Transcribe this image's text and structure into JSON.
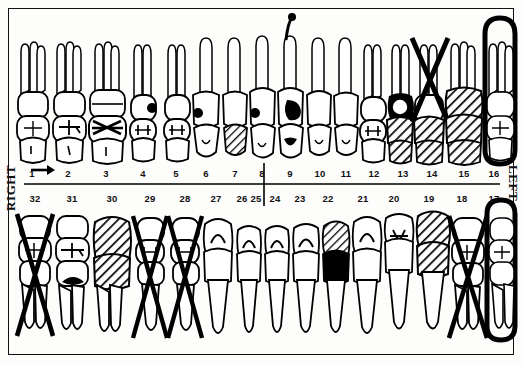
{
  "chart": {
    "type": "odontogram",
    "frame_color": "#111111",
    "background": "#fdfdfc",
    "ink_color": "#000000"
  },
  "labels": {
    "right": "RIGHT",
    "left": "LEFT",
    "arrow": "arrow-right"
  },
  "arch_upper": {
    "name": "maxillary-arch",
    "numbers": [
      "1",
      "2",
      "3",
      "4",
      "5",
      "6",
      "7",
      "8",
      "9",
      "10",
      "11",
      "12",
      "13",
      "14",
      "15",
      "16"
    ]
  },
  "arch_lower": {
    "name": "mandibular-arch",
    "numbers": [
      "32",
      "31",
      "30",
      "29",
      "28",
      "27",
      "26",
      "25",
      "24",
      "23",
      "22",
      "21",
      "20",
      "19",
      "18",
      "17"
    ]
  },
  "teeth_upper": [
    {
      "n": "1",
      "type": "molar",
      "mark": "none"
    },
    {
      "n": "2",
      "type": "molar",
      "mark": "occlusal-line"
    },
    {
      "n": "3",
      "type": "molar",
      "mark": "occlusal-cross"
    },
    {
      "n": "4",
      "type": "premolar",
      "mark": "occlusal-line"
    },
    {
      "n": "5",
      "type": "premolar",
      "mark": "occlusal-line"
    },
    {
      "n": "6",
      "type": "canine",
      "mark": "none"
    },
    {
      "n": "7",
      "type": "incisor",
      "mark": "hatched"
    },
    {
      "n": "8",
      "type": "incisor",
      "mark": "none"
    },
    {
      "n": "9",
      "type": "incisor",
      "mark": "filled-lesion"
    },
    {
      "n": "10",
      "type": "incisor",
      "mark": "none"
    },
    {
      "n": "11",
      "type": "canine",
      "mark": "none"
    },
    {
      "n": "12",
      "type": "premolar",
      "mark": "occlusal-line"
    },
    {
      "n": "13",
      "type": "premolar",
      "mark": "filled-hatched"
    },
    {
      "n": "14",
      "type": "molar",
      "mark": "extracted-x"
    },
    {
      "n": "15",
      "type": "molar",
      "mark": "hatched-full"
    },
    {
      "n": "16",
      "type": "molar",
      "mark": "ringed"
    }
  ],
  "teeth_lower": [
    {
      "n": "32",
      "type": "molar",
      "mark": "extracted-x"
    },
    {
      "n": "31",
      "type": "molar",
      "mark": "filled-lesion"
    },
    {
      "n": "30",
      "type": "molar",
      "mark": "hatched-full"
    },
    {
      "n": "29",
      "type": "premolar",
      "mark": "extracted-x"
    },
    {
      "n": "28",
      "type": "premolar",
      "mark": "extracted-x"
    },
    {
      "n": "27",
      "type": "canine",
      "mark": "none"
    },
    {
      "n": "26",
      "type": "incisor",
      "mark": "none"
    },
    {
      "n": "25",
      "type": "incisor",
      "mark": "none"
    },
    {
      "n": "24",
      "type": "incisor",
      "mark": "none"
    },
    {
      "n": "23",
      "type": "incisor",
      "mark": "hatched"
    },
    {
      "n": "22",
      "type": "canine",
      "mark": "none"
    },
    {
      "n": "21",
      "type": "premolar",
      "mark": "occlusal-line"
    },
    {
      "n": "20",
      "type": "premolar",
      "mark": "hatched-full"
    },
    {
      "n": "19",
      "type": "molar",
      "mark": "extracted-x"
    },
    {
      "n": "18",
      "type": "molar",
      "mark": "extracted-x"
    },
    {
      "n": "17",
      "type": "molar",
      "mark": "ringed"
    }
  ]
}
